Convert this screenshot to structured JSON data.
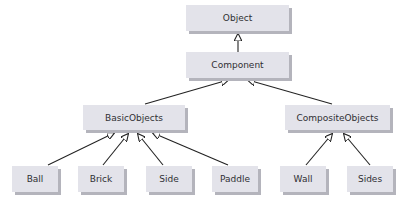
{
  "diagram": {
    "type": "uml-class-hierarchy",
    "nodes": [
      {
        "id": "object",
        "label": "Object",
        "x": 186,
        "y": 5,
        "w": 103,
        "h": 26
      },
      {
        "id": "component",
        "label": "Component",
        "x": 186,
        "y": 52,
        "w": 103,
        "h": 26
      },
      {
        "id": "basicobjects",
        "label": "BasicObjects",
        "x": 83,
        "y": 105,
        "w": 102,
        "h": 25
      },
      {
        "id": "compositeobjects",
        "label": "CompositeObjects",
        "x": 285,
        "y": 105,
        "w": 105,
        "h": 25
      },
      {
        "id": "ball",
        "label": "Ball",
        "x": 12,
        "y": 166,
        "w": 46,
        "h": 26
      },
      {
        "id": "brick",
        "label": "Brick",
        "x": 78,
        "y": 166,
        "w": 46,
        "h": 26
      },
      {
        "id": "side",
        "label": "Side",
        "x": 146,
        "y": 166,
        "w": 46,
        "h": 26
      },
      {
        "id": "paddle",
        "label": "Paddle",
        "x": 212,
        "y": 166,
        "w": 46,
        "h": 26
      },
      {
        "id": "wall",
        "label": "Wall",
        "x": 280,
        "y": 166,
        "w": 46,
        "h": 26
      },
      {
        "id": "sides",
        "label": "Sides",
        "x": 347,
        "y": 166,
        "w": 46,
        "h": 26
      }
    ],
    "edges": [
      {
        "from": "component",
        "to": "object",
        "relation": "inherits"
      },
      {
        "from": "basicobjects",
        "to": "component",
        "relation": "inherits"
      },
      {
        "from": "compositeobjects",
        "to": "component",
        "relation": "inherits"
      },
      {
        "from": "ball",
        "to": "basicobjects",
        "relation": "inherits"
      },
      {
        "from": "brick",
        "to": "basicobjects",
        "relation": "inherits"
      },
      {
        "from": "side",
        "to": "basicobjects",
        "relation": "inherits"
      },
      {
        "from": "paddle",
        "to": "basicobjects",
        "relation": "inherits"
      },
      {
        "from": "wall",
        "to": "compositeobjects",
        "relation": "inherits"
      },
      {
        "from": "sides",
        "to": "compositeobjects",
        "relation": "inherits"
      }
    ],
    "colors": {
      "box_fill": "#e3e3ea",
      "box_shadow": "#b4b4bc",
      "line": "#222222",
      "text": "#2f2f33"
    }
  }
}
